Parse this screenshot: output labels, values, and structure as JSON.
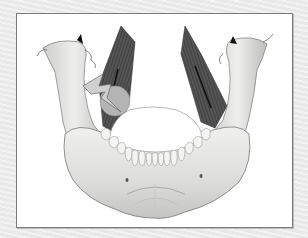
{
  "figure": {
    "elements": [
      {
        "name": "mandible",
        "description": "lower jaw bone with teeth"
      },
      {
        "name": "left-muscle",
        "description": "dark striated muscle band, left ramus"
      },
      {
        "name": "right-muscle",
        "description": "dark striated muscle band, right ramus"
      },
      {
        "name": "left-condyle-arrow",
        "description": "small black arrow at left condyle"
      },
      {
        "name": "right-condyle-arrow",
        "description": "small black arrow at right condyle"
      },
      {
        "name": "pain-lightning-bolt",
        "description": "gray lightning bolt indicating pain"
      },
      {
        "name": "pain-spot",
        "description": "gray circle marking pain area"
      }
    ],
    "colors": {
      "backdrop": "#ececec",
      "panel": "#ffffff",
      "panel_border": "#7c7c7c",
      "bone": "#e4e4e2",
      "bone_shade": "#b8b8b6",
      "muscle": "#4a4a4a",
      "pain_marker": "#b4b4b4",
      "arrow": "#111111"
    }
  }
}
